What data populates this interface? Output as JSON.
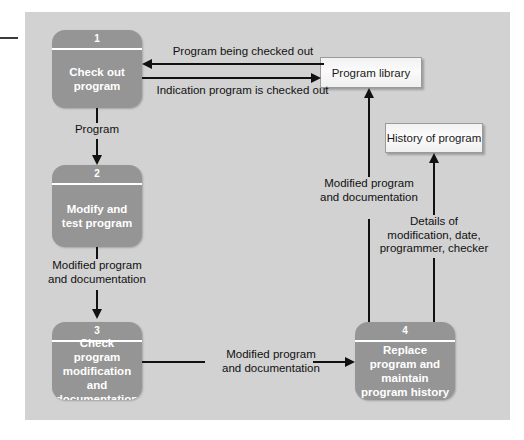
{
  "diagram": {
    "type": "data-flow-diagram",
    "background_color": "#d2d2d2",
    "process_fill_color": "#959595",
    "store_fill_color": "#f4f4f4",
    "line_color": "#111111"
  },
  "processes": [
    {
      "number": "1",
      "label": "Check out\nprogram"
    },
    {
      "number": "2",
      "label": "Modify and\ntest program"
    },
    {
      "number": "3",
      "label": "Check program\nmodification\nand\ndocumentation"
    },
    {
      "number": "4",
      "label": "Replace\nprogram and\nmaintain\nprogram history"
    }
  ],
  "stores": [
    {
      "label": "Program library"
    },
    {
      "label": "History of program"
    }
  ],
  "flows": [
    {
      "id": "f1",
      "label": "Program being checked out",
      "from": "Program library",
      "to": "1",
      "direction": "left"
    },
    {
      "id": "f2",
      "label": "Indication program is checked out",
      "from": "1",
      "to": "Program library",
      "direction": "right"
    },
    {
      "id": "f3",
      "label": "Program",
      "from": "1",
      "to": "2",
      "direction": "down"
    },
    {
      "id": "f4",
      "label": "Modified program\nand documentation",
      "from": "2",
      "to": "3",
      "direction": "down"
    },
    {
      "id": "f5",
      "label": "Modified program\nand documentation",
      "from": "3",
      "to": "4",
      "direction": "right"
    },
    {
      "id": "f6",
      "label": "Modified program\nand documentation",
      "from": "4",
      "to": "Program library",
      "direction": "up"
    },
    {
      "id": "f7",
      "label": "Details of\nmodification, date,\nprogrammer, checker",
      "from": "4",
      "to": "History of program",
      "direction": "up"
    }
  ]
}
